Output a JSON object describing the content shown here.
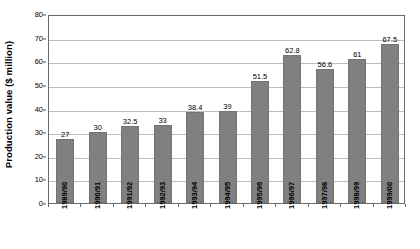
{
  "chart_data": {
    "type": "bar",
    "title": "",
    "xlabel": "",
    "ylabel": "Production value ($ million)",
    "ylim": [
      0,
      80
    ],
    "yticks": [
      0,
      10,
      20,
      30,
      40,
      50,
      60,
      70,
      80
    ],
    "grid": true,
    "legend": "none",
    "categories": [
      "1989/90",
      "1990/91",
      "1991/92",
      "1992/93",
      "1993/94",
      "1994/95",
      "1995/96",
      "1996/97",
      "1997/98",
      "1998/99",
      "1999/00"
    ],
    "values": [
      27,
      30,
      32.5,
      33,
      38.4,
      39,
      51.5,
      62.8,
      56.6,
      61,
      67.5
    ],
    "value_labels": [
      "27",
      "30",
      "32.5",
      "33",
      "38.4",
      "39",
      "51.5",
      "62.8",
      "56.6",
      "61",
      "67.5"
    ],
    "series": [
      {
        "name": "Production value",
        "values": [
          27,
          30,
          32.5,
          33,
          38.4,
          39,
          51.5,
          62.8,
          56.6,
          61,
          67.5
        ]
      }
    ],
    "colors": {
      "bar_fill": "#808080",
      "bar_stroke": "#737373",
      "gridline": "#bdbdbd",
      "axis": "#6b6b6b",
      "text": "#000000",
      "background": "#ffffff"
    }
  }
}
